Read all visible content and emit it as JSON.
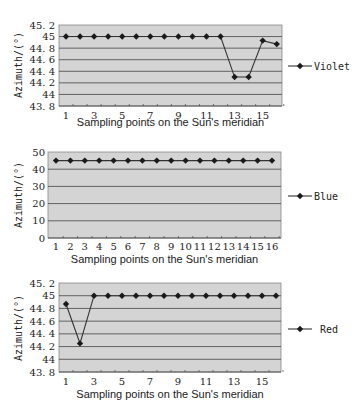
{
  "chart_data": [
    {
      "type": "line",
      "title": "",
      "series": [
        {
          "name": "Violet",
          "values": [
            45,
            45,
            45,
            45,
            45,
            45,
            45,
            45,
            45,
            45,
            45,
            45,
            44.3,
            44.3,
            44.93,
            44.87
          ]
        }
      ],
      "x": [
        1,
        2,
        3,
        4,
        5,
        6,
        7,
        8,
        9,
        10,
        11,
        12,
        13,
        14,
        15,
        16
      ],
      "xtick_labels": [
        "1",
        "3",
        "5",
        "7",
        "9",
        "11",
        "13",
        "15"
      ],
      "ytick_labels": [
        "43. 8",
        "44",
        "44. 2",
        "44. 4",
        "44. 6",
        "44. 8",
        "45",
        "45. 2"
      ],
      "xlabel": "Sampling points on the Sun's meridian",
      "ylabel": "Azimuth/(°)",
      "ylim": [
        43.8,
        45.2
      ],
      "grid": true,
      "legend_position": "right"
    },
    {
      "type": "line",
      "title": "",
      "series": [
        {
          "name": "Blue",
          "values": [
            45,
            45,
            45,
            45,
            45,
            45,
            45,
            45,
            45,
            45,
            45,
            45,
            45,
            45,
            45,
            45
          ]
        }
      ],
      "x": [
        1,
        2,
        3,
        4,
        5,
        6,
        7,
        8,
        9,
        10,
        11,
        12,
        13,
        14,
        15,
        16
      ],
      "xtick_labels": [
        "1",
        "2",
        "3",
        "4",
        "5",
        "6",
        "7",
        "8",
        "9",
        "10",
        "11",
        "12",
        "13",
        "14",
        "15",
        "16"
      ],
      "ytick_labels": [
        "0",
        "10",
        "20",
        "30",
        "40",
        "50"
      ],
      "xlabel": "Sampling points on the Sun's meridian",
      "ylabel": "Azimuth/(°)",
      "ylim": [
        0,
        50
      ],
      "grid": true,
      "legend_position": "right"
    },
    {
      "type": "line",
      "title": "",
      "series": [
        {
          "name": "Red",
          "values": [
            44.87,
            44.25,
            45,
            45,
            45,
            45,
            45,
            45,
            45,
            45,
            45,
            45,
            45,
            45,
            45,
            45
          ]
        }
      ],
      "x": [
        1,
        2,
        3,
        4,
        5,
        6,
        7,
        8,
        9,
        10,
        11,
        12,
        13,
        14,
        15,
        16
      ],
      "xtick_labels": [
        "1",
        "3",
        "5",
        "7",
        "9",
        "11",
        "13",
        "15"
      ],
      "ytick_labels": [
        "43. 8",
        "44",
        "44. 2",
        "44. 4",
        "44. 6",
        "44. 8",
        "45",
        "45. 2"
      ],
      "xlabel": "Sampling points on the Sun's meridian",
      "ylabel": "Azimuth/(°)",
      "ylim": [
        43.8,
        45.2
      ],
      "grid": true,
      "legend_position": "right"
    }
  ],
  "charts": [
    {
      "legend": "Violet",
      "xlabel": "Sampling points on the Sun's meridian",
      "ylabel": "Azimuth/(°)"
    },
    {
      "legend": "Blue",
      "xlabel": "Sampling points on the Sun's meridian",
      "ylabel": "Azimuth/(°)"
    },
    {
      "legend": "Red",
      "xlabel": "Sampling points on the Sun's meridian",
      "ylabel": "Azimuth/(°)"
    }
  ],
  "style": {
    "plot_bg": "#d4d4d4",
    "grid_color": "#555555",
    "line_color": "#333333",
    "marker_color": "#1a1a1a",
    "red_line_color": "#444444"
  }
}
